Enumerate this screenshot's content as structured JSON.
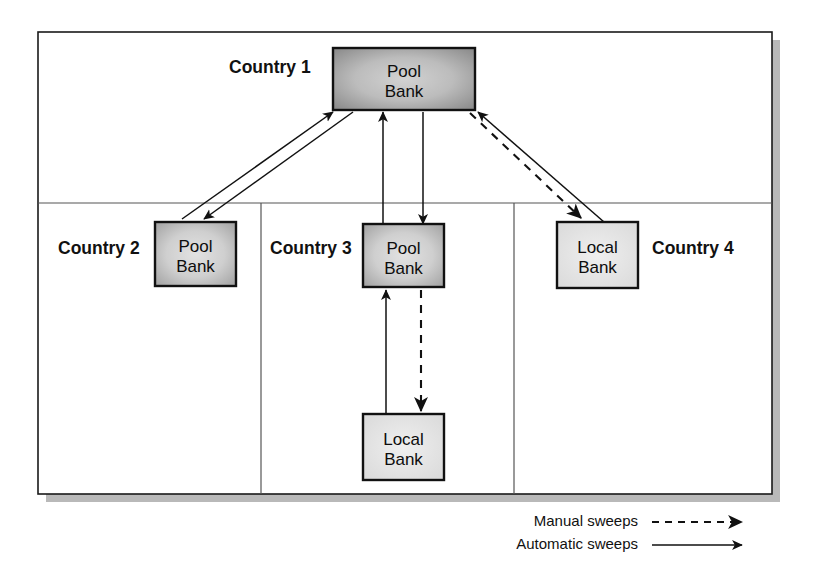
{
  "diagram": {
    "frame": {
      "x": 38,
      "y": 32,
      "w": 734,
      "h": 462,
      "shadow_offset": 8,
      "border_color": "#1a1a1a",
      "shadow_color": "#b9b9b9",
      "fill": "#ffffff"
    },
    "divider_color": "#555555",
    "horizontal_divider": {
      "y": 203
    },
    "vertical_dividers": [
      {
        "x": 261
      },
      {
        "x": 514
      }
    ],
    "countries": [
      {
        "id": "country-1",
        "label": "Country 1",
        "label_x": 229,
        "label_y": 57
      },
      {
        "id": "country-2",
        "label": "Country 2",
        "label_x": 58,
        "label_y": 238
      },
      {
        "id": "country-3",
        "label": "Country 3",
        "label_x": 270,
        "label_y": 238
      },
      {
        "id": "country-4",
        "label": "Country 4",
        "label_x": 652,
        "label_y": 238
      }
    ],
    "nodes": [
      {
        "id": "pool-bank-country-1",
        "kind": "pool",
        "line1": "Pool",
        "line2": "Bank",
        "x": 333,
        "y": 48,
        "w": 142,
        "h": 62,
        "fill_center": "#c9c9c9",
        "fill_edge": "#8a8a8a"
      },
      {
        "id": "pool-bank-country-2",
        "kind": "pool",
        "line1": "Pool",
        "line2": "Bank",
        "x": 155,
        "y": 222,
        "w": 81,
        "h": 64,
        "fill_center": "#dadada",
        "fill_edge": "#a2a2a2"
      },
      {
        "id": "pool-bank-country-3",
        "kind": "pool",
        "line1": "Pool",
        "line2": "Bank",
        "x": 363,
        "y": 224,
        "w": 81,
        "h": 63,
        "fill_center": "#dadada",
        "fill_edge": "#a2a2a2"
      },
      {
        "id": "local-bank-country-4",
        "kind": "local",
        "line1": "Local",
        "line2": "Bank",
        "x": 557,
        "y": 222,
        "w": 81,
        "h": 66,
        "fill_center": "#e6e6e6",
        "fill_edge": "#dcdcdc"
      },
      {
        "id": "local-bank-country-3",
        "kind": "local",
        "line1": "Local",
        "line2": "Bank",
        "x": 363,
        "y": 414,
        "w": 81,
        "h": 66,
        "fill_center": "#e6e6e6",
        "fill_edge": "#dcdcdc"
      }
    ],
    "flows": [
      {
        "id": "flow-c2-pool-to-c1-pool",
        "type": "automatic",
        "from": "pool-bank-country-2",
        "to": "pool-bank-country-1",
        "x1": 182,
        "y1": 219,
        "x2": 333,
        "y2": 112
      },
      {
        "id": "flow-c1-pool-to-c2-pool",
        "type": "automatic",
        "from": "pool-bank-country-1",
        "to": "pool-bank-country-2",
        "x1": 353,
        "y1": 112,
        "x2": 204,
        "y2": 219
      },
      {
        "id": "flow-c3-pool-to-c1-pool",
        "type": "automatic",
        "from": "pool-bank-country-3",
        "to": "pool-bank-country-1",
        "x1": 383,
        "y1": 224,
        "x2": 383,
        "y2": 112
      },
      {
        "id": "flow-c1-pool-to-c3-pool",
        "type": "automatic",
        "from": "pool-bank-country-1",
        "to": "pool-bank-country-3",
        "x1": 423,
        "y1": 112,
        "x2": 423,
        "y2": 224
      },
      {
        "id": "flow-c4-local-to-c1-pool",
        "type": "automatic",
        "from": "local-bank-country-4",
        "to": "pool-bank-country-1",
        "x1": 604,
        "y1": 222,
        "x2": 478,
        "y2": 112
      },
      {
        "id": "flow-c1-pool-to-c4-local",
        "type": "manual",
        "from": "pool-bank-country-1",
        "to": "local-bank-country-4",
        "x1": 470,
        "y1": 113,
        "x2": 581,
        "y2": 218
      },
      {
        "id": "flow-c3-local-to-c3-pool",
        "type": "automatic",
        "from": "local-bank-country-3",
        "to": "pool-bank-country-3",
        "x1": 386,
        "y1": 414,
        "x2": 386,
        "y2": 290
      },
      {
        "id": "flow-c3-pool-to-c3-local",
        "type": "manual",
        "from": "pool-bank-country-3",
        "to": "local-bank-country-3",
        "x1": 421,
        "y1": 290,
        "x2": 421,
        "y2": 411
      }
    ],
    "legend": {
      "items": [
        {
          "id": "legend-manual",
          "label": "Manual sweeps",
          "style": "dashed",
          "label_x": 638,
          "label_y": 521,
          "line_x1": 652,
          "line_x2": 742,
          "line_y": 517
        },
        {
          "id": "legend-automatic",
          "label": "Automatic sweeps",
          "style": "solid",
          "label_x": 638,
          "label_y": 544,
          "line_x1": 652,
          "line_x2": 742,
          "line_y": 540
        }
      ]
    }
  }
}
